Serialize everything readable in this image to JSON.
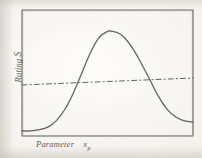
{
  "figure": {
    "kind": "hand-drawn-line-plot",
    "background_color": "#f7f5f1",
    "ink_color": "#55534f",
    "frame": {
      "left": 22,
      "top": 10,
      "right": 193,
      "bottom": 136,
      "stroke_color": "#5a5854",
      "stroke_width": 1.1
    },
    "y_axis": {
      "label_text": "Rating",
      "label_symbol": "S",
      "rotated_degrees": -90,
      "ticks": [],
      "tick_labels": []
    },
    "x_axis": {
      "label_text": "Parameter",
      "label_symbol": "x",
      "label_subscript": "p",
      "ticks": [],
      "tick_labels": []
    }
  },
  "chart_data": {
    "type": "line",
    "title": "",
    "subtitle": "",
    "xlabel": "Parameter x_p",
    "ylabel": "Rating S",
    "xlim": [
      0,
      1
    ],
    "ylim": [
      0,
      1
    ],
    "grid": false,
    "legend": "none",
    "annotations": [],
    "series": [
      {
        "name": "Rating response curve",
        "style": "solid",
        "color": "#55534f",
        "comment": "bell / hump shaped curve, flat at left, peak near x=0.53, decaying to the right edge",
        "x": [
          0.0,
          0.05,
          0.1,
          0.15,
          0.2,
          0.25,
          0.3,
          0.35,
          0.4,
          0.45,
          0.5,
          0.53,
          0.56,
          0.6,
          0.65,
          0.7,
          0.75,
          0.8,
          0.85,
          0.9,
          0.95,
          1.0
        ],
        "y": [
          0.04,
          0.04,
          0.05,
          0.07,
          0.12,
          0.21,
          0.34,
          0.5,
          0.66,
          0.78,
          0.83,
          0.83,
          0.82,
          0.78,
          0.69,
          0.57,
          0.44,
          0.31,
          0.21,
          0.15,
          0.12,
          0.11
        ]
      },
      {
        "name": "Reference / cost line",
        "style": "dashed",
        "color": "#55534f",
        "comment": "nearly horizontal dash-dot line rising gently from left to right",
        "x": [
          0.0,
          1.0
        ],
        "y": [
          0.405,
          0.46
        ]
      }
    ],
    "intersections": [
      {
        "label": "",
        "x": 0.315,
        "y": 0.42
      },
      {
        "label": "",
        "x": 0.775,
        "y": 0.45
      }
    ]
  }
}
